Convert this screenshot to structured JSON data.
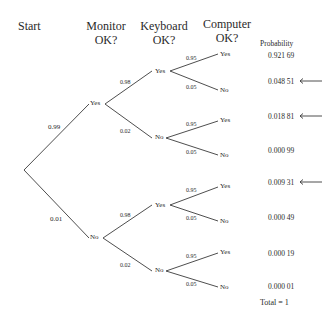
{
  "headers": {
    "start": "Start",
    "monitor_line1": "Monitor",
    "monitor_line2": "OK?",
    "keyboard_line1": "Keyboard",
    "keyboard_line2": "OK?",
    "computer_line1": "Computer",
    "computer_line2": "OK?",
    "probability": "Probability"
  },
  "level1": {
    "yes": {
      "label": "Yes",
      "prob": "0.99"
    },
    "no": {
      "label": "No",
      "prob": "0.01"
    }
  },
  "level2": [
    {
      "label": "Yes",
      "prob": "0.98"
    },
    {
      "label": "No",
      "prob": "0.02"
    },
    {
      "label": "Yes",
      "prob": "0.98"
    },
    {
      "label": "No",
      "prob": "0.02"
    }
  ],
  "level3": [
    {
      "label": "Yes",
      "prob": "0.95"
    },
    {
      "label": "No",
      "prob": "0.05"
    },
    {
      "label": "Yes",
      "prob": "0.95"
    },
    {
      "label": "No",
      "prob": "0.05"
    },
    {
      "label": "Yes",
      "prob": "0.95"
    },
    {
      "label": "No",
      "prob": "0.05"
    },
    {
      "label": "Yes",
      "prob": "0.95"
    },
    {
      "label": "No",
      "prob": "0.05"
    }
  ],
  "outcomes": [
    {
      "probability": "0.921 69",
      "arrow": false
    },
    {
      "probability": "0.048 51",
      "arrow": true
    },
    {
      "probability": "0.018 81",
      "arrow": true
    },
    {
      "probability": "0.000 99",
      "arrow": false
    },
    {
      "probability": "0.009 31",
      "arrow": true
    },
    {
      "probability": "0.000 49",
      "arrow": false
    },
    {
      "probability": "0.000 19",
      "arrow": false
    },
    {
      "probability": "0.000 01",
      "arrow": false
    }
  ],
  "total": "Total = 1"
}
